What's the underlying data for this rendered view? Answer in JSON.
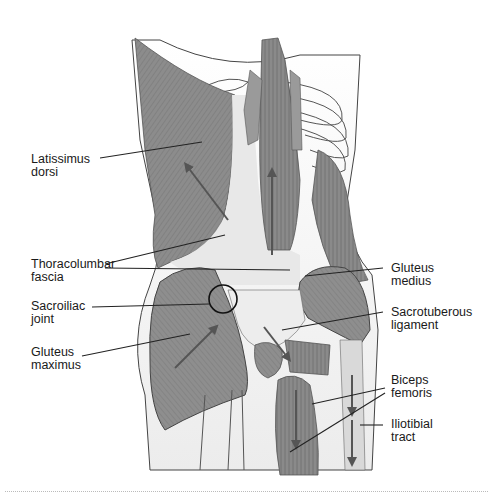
{
  "figure": {
    "type": "anatomical-illustration",
    "view": "posterior back and hip musculature",
    "colors": {
      "muscle": "#8a8a8a",
      "muscle_dark": "#6e6e6e",
      "fascia": "#e6e6e6",
      "skin": "#f2f2f2",
      "outline": "#333333",
      "arrow": "#555555",
      "leader": "#222222"
    }
  },
  "labels": {
    "latissimus_dorsi": {
      "line1": "Latissimus",
      "line2": "dorsi"
    },
    "thoracolumbar_fascia": {
      "line1": "Thoracolumbar",
      "line2": "fascia"
    },
    "sacroiliac_joint": {
      "line1": "Sacroiliac",
      "line2": "joint"
    },
    "gluteus_maximus": {
      "line1": "Gluteus",
      "line2": "maximus"
    },
    "gluteus_medius": {
      "line1": "Gluteus",
      "line2": "medius"
    },
    "sacrotuberous_ligament": {
      "line1": "Sacrotuberous",
      "line2": "ligament"
    },
    "biceps_femoris": {
      "line1": "Biceps",
      "line2": "femoris"
    },
    "iliotibial_tract": {
      "line1": "Iliotibial",
      "line2": "tract"
    }
  }
}
